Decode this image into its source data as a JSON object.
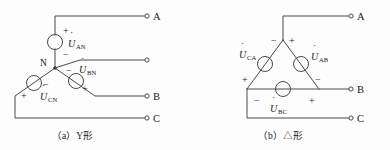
{
  "figure": {
    "background_color": "#fdfdfd",
    "line_color": "#4a4a4a",
    "text_color": "#1a1a1a"
  },
  "diagram_a": {
    "caption": "（a）Y形",
    "center_node_label": "N",
    "terminals": [
      {
        "label": "A",
        "x": 148,
        "y": 16
      },
      {
        "label": "",
        "x": 148,
        "y": 60
      },
      {
        "label": "B",
        "x": 148,
        "y": 96
      },
      {
        "label": "C",
        "x": 148,
        "y": 118
      }
    ],
    "sources": [
      {
        "name": "U_AN",
        "symbol": "U",
        "subscript": "AN",
        "plus_sign": "+",
        "minus_sign": "−",
        "plus_x": 67,
        "plus_y": 30,
        "minus_x": 67,
        "minus_y": 59,
        "label_x": 70,
        "label_y": 45
      },
      {
        "name": "U_BN",
        "symbol": "U",
        "subscript": "BN",
        "plus_sign": "+",
        "minus_sign": "−",
        "plus_x": 82,
        "plus_y": 88,
        "minus_x": 69,
        "minus_y": 70,
        "label_x": 82,
        "label_y": 71
      },
      {
        "name": "U_CN",
        "symbol": "U",
        "subscript": "CN",
        "plus_sign": "+",
        "minus_sign": "−",
        "plus_x": 25,
        "plus_y": 96,
        "minus_x": 46,
        "minus_y": 84,
        "label_x": 42,
        "label_y": 98
      }
    ]
  },
  "diagram_b": {
    "caption": "（b）△形",
    "terminals": [
      {
        "label": "A",
        "x": 352,
        "y": 16
      },
      {
        "label": "B",
        "x": 352,
        "y": 89
      },
      {
        "label": "C",
        "x": 352,
        "y": 118
      }
    ],
    "sources": [
      {
        "name": "U_CA",
        "symbol": "U",
        "subscript": "CA",
        "plus_sign": "+",
        "minus_sign": "−",
        "plus_x": 245,
        "plus_y": 80,
        "minus_x": 274,
        "minus_y": 41,
        "label_x": 238,
        "label_y": 55
      },
      {
        "name": "U_AB",
        "symbol": "U",
        "subscript": "AB",
        "plus_sign": "+",
        "minus_sign": "−",
        "plus_x": 291,
        "plus_y": 41,
        "minus_x": 318,
        "minus_y": 80,
        "label_x": 312,
        "label_y": 57
      },
      {
        "name": "U_BC",
        "symbol": "U",
        "subscript": "BC",
        "plus_sign": "+",
        "minus_sign": "−",
        "plus_x": 310,
        "plus_y": 103,
        "minus_x": 255,
        "minus_y": 103,
        "label_x": 271,
        "label_y": 110
      }
    ]
  }
}
